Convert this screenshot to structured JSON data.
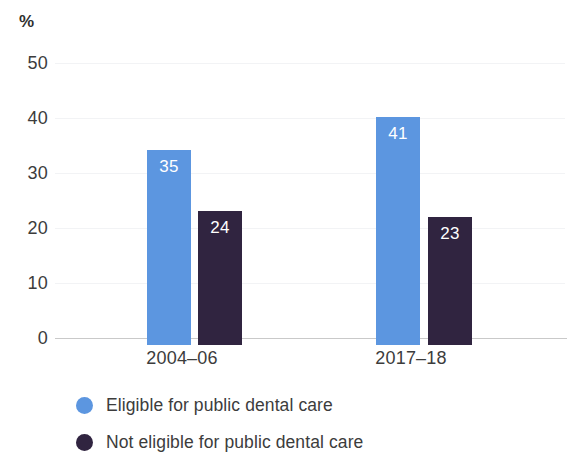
{
  "chart_data": {
    "type": "bar",
    "title": "",
    "subtitle": "",
    "xlabel": "",
    "ylabel": "",
    "y_unit_label": "%",
    "categories": [
      "2004–06",
      "2017–18"
    ],
    "series": [
      {
        "name": "Eligible for public dental care",
        "color": "#5c96e0",
        "values": [
          35,
          41
        ],
        "value_labels": [
          "35",
          "41"
        ]
      },
      {
        "name": "Not eligible for public dental care",
        "color": "#302440",
        "values": [
          24,
          23
        ],
        "value_labels": [
          "24",
          "23"
        ]
      }
    ],
    "ylim": [
      0,
      50
    ],
    "y_ticks": [
      0,
      10,
      20,
      30,
      40,
      50
    ],
    "y_tick_labels": [
      "0",
      "10",
      "20",
      "30",
      "40",
      "50"
    ],
    "grid": true,
    "grid_axis": "y",
    "legend_position": "bottom-left",
    "bar_value_label_color": "#ffffff",
    "axis_text_color": "#3c3c3c",
    "background_color": "#ffffff"
  },
  "legend": {
    "items": [
      {
        "label": "Eligible for public dental care",
        "color": "#5c96e0"
      },
      {
        "label": "Not eligible for public dental care",
        "color": "#302440"
      }
    ]
  }
}
